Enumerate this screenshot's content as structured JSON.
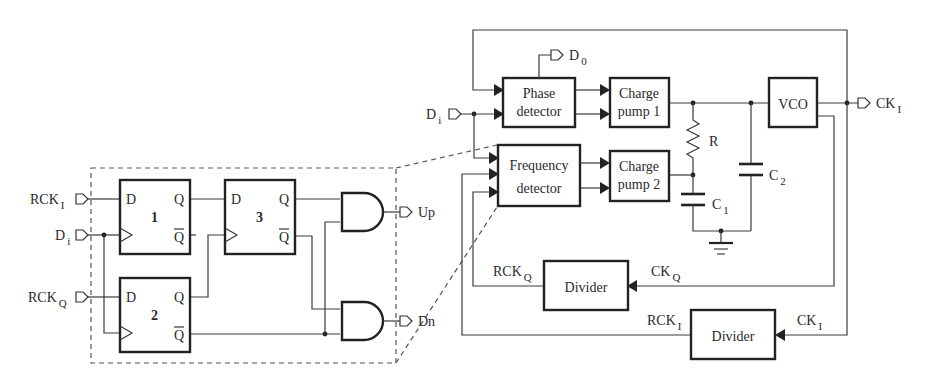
{
  "diagram": {
    "type": "block-diagram",
    "inputs": {
      "di_main": {
        "base": "D",
        "sub": "i"
      }
    },
    "outputs": {
      "d0": {
        "base": "D",
        "sub": "0"
      },
      "cki": {
        "base": "CK",
        "sub": "I"
      }
    },
    "blocks": {
      "phase_detector": {
        "line1": "Phase",
        "line2": "detector"
      },
      "charge_pump_1": {
        "line1": "Charge",
        "line2": "pump 1"
      },
      "frequency_detector": {
        "line1": "Frequency",
        "line2": "detector"
      },
      "charge_pump_2": {
        "line1": "Charge",
        "line2": "pump 2"
      },
      "vco": {
        "label": "VCO"
      },
      "divider_q": {
        "label": "Divider"
      },
      "divider_i": {
        "label": "Divider"
      }
    },
    "components": {
      "resistor": {
        "label": "R"
      },
      "c1": {
        "base": "C",
        "sub": "1"
      },
      "c2": {
        "base": "C",
        "sub": "2"
      }
    },
    "signals": {
      "rckq": {
        "base": "RCK",
        "sub": "Q"
      },
      "ckq": {
        "base": "CK",
        "sub": "Q"
      },
      "rcki": {
        "base": "RCK",
        "sub": "I"
      },
      "cki_div": {
        "base": "CK",
        "sub": "I"
      }
    },
    "detail": {
      "inputs": {
        "rcki": {
          "base": "RCK",
          "sub": "I"
        },
        "di": {
          "base": "D",
          "sub": "i"
        },
        "rckq": {
          "base": "RCK",
          "sub": "Q"
        }
      },
      "flipflops": [
        {
          "id": "1",
          "d": "D",
          "q": "Q",
          "qbar": "Q"
        },
        {
          "id": "2",
          "d": "D",
          "q": "Q",
          "qbar": "Q"
        },
        {
          "id": "3",
          "d": "D",
          "q": "Q",
          "qbar": "Q"
        }
      ],
      "outputs": {
        "up": "Up",
        "dn": "Dn"
      }
    }
  }
}
